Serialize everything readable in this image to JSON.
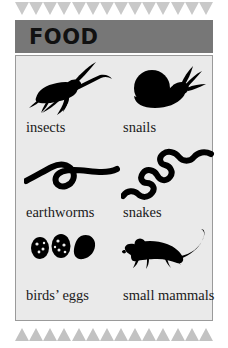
{
  "card": {
    "header": {
      "title": "FOOD",
      "band_color": "#777777",
      "text_color": "#111111"
    },
    "panel": {
      "background_color": "#eaeaea",
      "border_color": "#9a9a9a"
    },
    "border_decor": {
      "top_icon": "triangle-down-icon",
      "bottom_icon": "triangle-up-icon",
      "top_count": 14,
      "bottom_count": 14,
      "top_color": "#c9c9c9",
      "bottom_color": "#c2c2c2"
    },
    "items": [
      {
        "label": "insects",
        "icon": "cricket-silhouette-icon"
      },
      {
        "label": "snails",
        "icon": "snail-silhouette-icon"
      },
      {
        "label": "earthworms",
        "icon": "earthworm-silhouette-icon"
      },
      {
        "label": "snakes",
        "icon": "snake-silhouette-icon"
      },
      {
        "label": "birds’ eggs",
        "icon": "bird-eggs-silhouette-icon"
      },
      {
        "label": "small mammals",
        "icon": "mouse-silhouette-icon"
      }
    ],
    "art_color": "#000000"
  }
}
